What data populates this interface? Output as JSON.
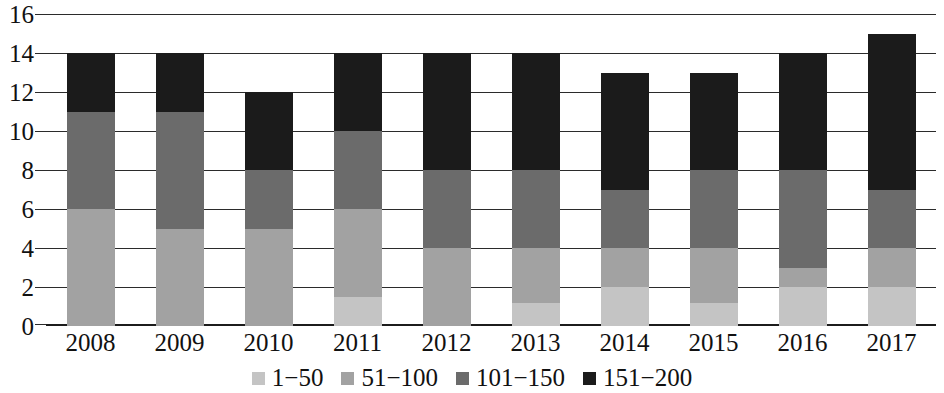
{
  "chart_data": {
    "type": "bar",
    "stacked": true,
    "title": "",
    "subtitle": "",
    "xlabel": "",
    "ylabel": "",
    "categories": [
      "2008",
      "2009",
      "2010",
      "2011",
      "2012",
      "2013",
      "2014",
      "2015",
      "2016",
      "2017"
    ],
    "series": [
      {
        "name": "1−50",
        "color": "#c4c4c4",
        "values": [
          0,
          0,
          0,
          1.5,
          0,
          1.2,
          2,
          1.2,
          2,
          2
        ]
      },
      {
        "name": "51−100",
        "color": "#a2a2a2",
        "values": [
          6,
          5,
          5,
          4.5,
          4,
          2.8,
          2,
          2.8,
          1,
          2
        ]
      },
      {
        "name": "101−150",
        "color": "#6b6b6b",
        "values": [
          5,
          6,
          3,
          4,
          4,
          4,
          3,
          4,
          5,
          3
        ]
      },
      {
        "name": "151−200",
        "color": "#1b1b1b",
        "values": [
          3,
          3,
          4,
          4,
          6,
          6,
          6,
          5,
          6,
          8
        ]
      }
    ],
    "totals": [
      14,
      14,
      12,
      14,
      14,
      14,
      13,
      13,
      14,
      15
    ],
    "ylim": [
      0,
      16
    ],
    "ytick_step": 2,
    "yticks": [
      "16",
      "14",
      "12",
      "10",
      "8",
      "6",
      "4",
      "2",
      "0"
    ],
    "grid": true,
    "grid_axis": "y",
    "legend_position": "bottom"
  },
  "legend": {
    "items": [
      {
        "label": "1−50",
        "color": "#c4c4c4"
      },
      {
        "label": "51−100",
        "color": "#a2a2a2"
      },
      {
        "label": "101−150",
        "color": "#6b6b6b"
      },
      {
        "label": "151−200",
        "color": "#1b1b1b"
      }
    ]
  },
  "colors": {
    "axis": "#2b2b2b",
    "background": "#ffffff",
    "text": "#111111"
  }
}
